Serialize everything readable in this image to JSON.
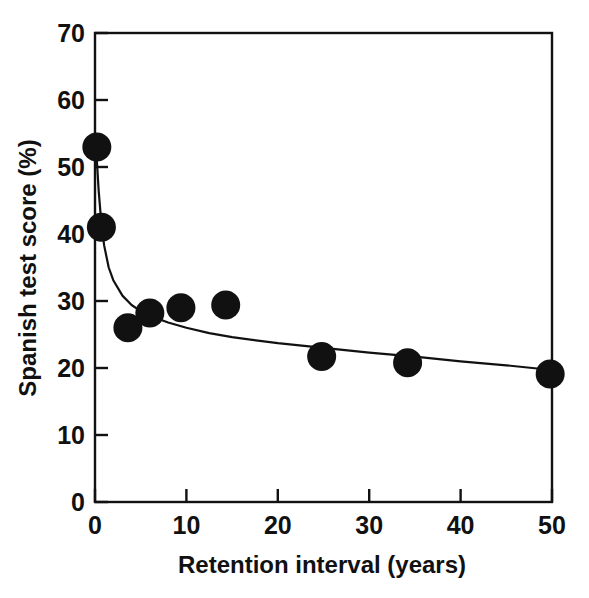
{
  "chart_data": {
    "type": "scatter",
    "title": "",
    "xlabel": "Retention interval (years)",
    "ylabel": "Spanish test score (%)",
    "xlim": [
      0,
      50
    ],
    "ylim": [
      0,
      70
    ],
    "xticks": [
      0,
      10,
      20,
      30,
      40,
      50
    ],
    "yticks": [
      0,
      10,
      20,
      30,
      40,
      50,
      60,
      70
    ],
    "xtick_labels": [
      "0",
      "10",
      "20",
      "30",
      "40",
      "50"
    ],
    "ytick_labels": [
      "0",
      "10",
      "20",
      "30",
      "40",
      "50",
      "60",
      "70"
    ],
    "grid": false,
    "legend": false,
    "marker_color": "#111111",
    "line_color": "#111111",
    "series": [
      {
        "name": "Spanish test score",
        "marker": "filled-circle",
        "x": [
          0.2,
          0.7,
          3.6,
          6.0,
          9.4,
          14.3,
          24.8,
          34.2,
          49.8
        ],
        "y": [
          53.0,
          41.0,
          26.0,
          28.2,
          29.0,
          29.4,
          21.7,
          20.8,
          19.1
        ]
      },
      {
        "name": "fitted decay curve",
        "marker": "none",
        "x": [
          0.0,
          0.2,
          0.4,
          0.7,
          1.0,
          1.5,
          2.0,
          3.0,
          4.0,
          5.0,
          6.0,
          8.0,
          10.0,
          12.5,
          15.0,
          20.0,
          25.0,
          30.0,
          35.0,
          40.0,
          45.0,
          50.0
        ],
        "y": [
          55.0,
          51.0,
          46.5,
          41.5,
          38.3,
          35.0,
          33.1,
          30.8,
          29.4,
          28.5,
          27.8,
          26.8,
          26.0,
          25.2,
          24.6,
          23.7,
          23.0,
          22.3,
          21.7,
          21.0,
          20.4,
          19.7
        ]
      }
    ]
  },
  "axes": {
    "x_title": "Retention interval (years)",
    "y_title": "Spanish test score (%)"
  }
}
